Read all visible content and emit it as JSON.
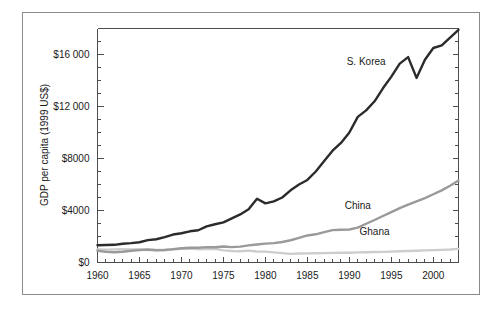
{
  "figure": {
    "background_color": "#ffffff",
    "frame_color": "#8a8a8a",
    "axis_color": "#4d4d4d"
  },
  "axis": {
    "y_title": "GDP per capita (1999 US$)",
    "x_title": "",
    "y_tick_labels": [
      "$0",
      "$4000",
      "$8000",
      "$12 000",
      "$16 000"
    ],
    "x_tick_labels": [
      "1960",
      "1965",
      "1970",
      "1975",
      "1980",
      "1985",
      "1990",
      "1995",
      "2000"
    ]
  },
  "labels": {
    "skorea": "S. Korea",
    "china": "China",
    "ghana": "Ghana"
  },
  "chart_data": {
    "type": "line",
    "title": "",
    "xlabel": "",
    "ylabel": "GDP per capita (1999 US$)",
    "xlim": [
      1960,
      2003
    ],
    "ylim": [
      0,
      18000
    ],
    "ytick_values": [
      0,
      4000,
      8000,
      12000,
      16000
    ],
    "ytick_labels": [
      "$0",
      "$4000",
      "$8000",
      "$12 000",
      "$16 000"
    ],
    "xtick_values": [
      1960,
      1965,
      1970,
      1975,
      1980,
      1985,
      1990,
      1995,
      2000
    ],
    "xtick_minor_step": 1,
    "grid": false,
    "legend": "inline-annotations",
    "x": [
      1960,
      1961,
      1962,
      1963,
      1964,
      1965,
      1966,
      1967,
      1968,
      1969,
      1970,
      1971,
      1972,
      1973,
      1974,
      1975,
      1976,
      1977,
      1978,
      1979,
      1980,
      1981,
      1982,
      1983,
      1984,
      1985,
      1986,
      1987,
      1988,
      1989,
      1990,
      1991,
      1992,
      1993,
      1994,
      1995,
      1996,
      1997,
      1998,
      1999,
      2000,
      2001,
      2002,
      2003
    ],
    "series": [
      {
        "name": "S. Korea",
        "color": "#2b2b2b",
        "line_width": 2.4,
        "label_position": {
          "year": 1992,
          "value": 15200
        },
        "values": [
          1330,
          1350,
          1360,
          1440,
          1490,
          1560,
          1720,
          1790,
          1950,
          2150,
          2250,
          2400,
          2480,
          2780,
          2940,
          3090,
          3400,
          3700,
          4100,
          4900,
          4550,
          4700,
          5000,
          5550,
          6000,
          6350,
          7000,
          7800,
          8600,
          9200,
          10000,
          11200,
          11700,
          12400,
          13400,
          14300,
          15300,
          15800,
          14200,
          15600,
          16500,
          16700,
          17300,
          17900
        ]
      },
      {
        "name": "China",
        "color": "#9a9a9a",
        "line_width": 2.4,
        "label_position": {
          "year": 1991,
          "value": 4100
        },
        "values": [
          900,
          830,
          790,
          830,
          900,
          950,
          1000,
          940,
          960,
          1030,
          1100,
          1130,
          1130,
          1180,
          1170,
          1230,
          1180,
          1220,
          1320,
          1380,
          1450,
          1490,
          1580,
          1710,
          1890,
          2080,
          2170,
          2330,
          2490,
          2520,
          2540,
          2680,
          2980,
          3270,
          3580,
          3880,
          4180,
          4450,
          4700,
          4950,
          5250,
          5550,
          5900,
          6300
        ]
      },
      {
        "name": "Ghana",
        "color": "#cdcdcd",
        "line_width": 2.4,
        "label_position": {
          "year": 1993,
          "value": 2150
        },
        "values": [
          1000,
          990,
          1010,
          1020,
          1010,
          1020,
          960,
          960,
          960,
          990,
          1050,
          1070,
          1020,
          1030,
          1060,
          930,
          880,
          860,
          910,
          850,
          840,
          780,
          720,
          660,
          690,
          700,
          710,
          720,
          740,
          760,
          750,
          780,
          790,
          810,
          820,
          840,
          860,
          880,
          900,
          930,
          950,
          970,
          1000,
          1050
        ]
      }
    ]
  }
}
